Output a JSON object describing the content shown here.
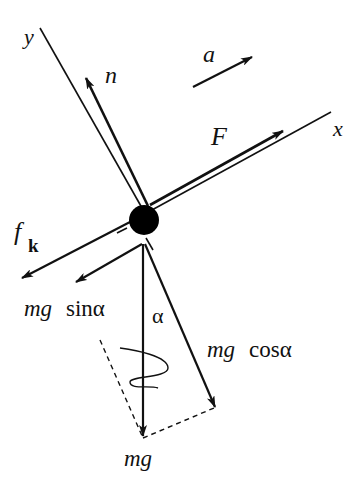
{
  "diagram": {
    "axes": {
      "x_label": "x",
      "y_label": "y"
    },
    "forces": {
      "normal": "n",
      "applied": "F",
      "friction_main": "f",
      "friction_sub": "k",
      "gravity": "mg",
      "gravity_parallel_prefix": "mg",
      "gravity_parallel_func": "sinα",
      "gravity_perp_prefix": "mg",
      "gravity_perp_func": "cosα"
    },
    "acceleration": "a",
    "angle": "α",
    "colors": {
      "ink": "#111111",
      "background": "#ffffff"
    }
  }
}
